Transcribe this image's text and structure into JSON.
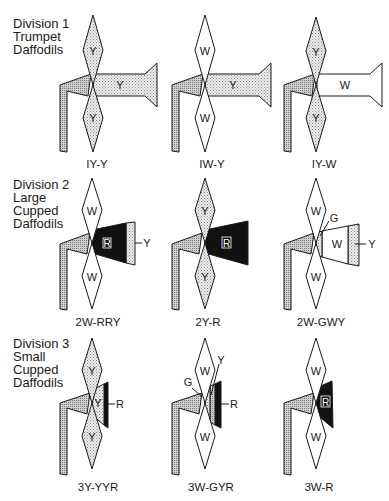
{
  "divisions": [
    {
      "heading": [
        "Division 1",
        "Trumpet",
        "Daffodils"
      ]
    },
    {
      "heading": [
        "Division 2",
        "Large",
        "Cupped",
        "Daffodils"
      ]
    },
    {
      "heading": [
        "Division 3",
        "Small",
        "Cupped",
        "Daffodils"
      ]
    }
  ],
  "flowers": [
    {
      "code": "IY-Y",
      "perianth": "Y",
      "corona": [
        "Y"
      ]
    },
    {
      "code": "IW-Y",
      "perianth": "W",
      "corona": [
        "Y"
      ]
    },
    {
      "code": "IY-W",
      "perianth": "Y",
      "corona": [
        "W"
      ]
    },
    {
      "code": "2W-RRY",
      "perianth": "W",
      "corona": [
        "R",
        "Y"
      ]
    },
    {
      "code": "2Y-R",
      "perianth": "Y",
      "corona": [
        "R"
      ]
    },
    {
      "code": "2W-GWY",
      "perianth": "W",
      "corona": [
        "G",
        "W",
        "Y"
      ]
    },
    {
      "code": "3Y-YYR",
      "perianth": "Y",
      "corona": [
        "Y",
        "R"
      ]
    },
    {
      "code": "3W-GYR",
      "perianth": "W",
      "corona": [
        "G",
        "Y",
        "R"
      ]
    },
    {
      "code": "3W-R",
      "perianth": "W",
      "corona": [
        "R"
      ]
    }
  ],
  "colors": {
    "outline": "#1a1a1a",
    "dotted_fill": "#e2e2e2",
    "stem_fill": "#c8c8c8",
    "black": "#111111",
    "white": "#ffffff"
  }
}
